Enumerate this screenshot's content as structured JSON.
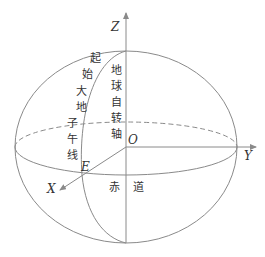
{
  "diagram": {
    "axes": {
      "z_label": "Z",
      "y_label": "Y",
      "x_label": "X",
      "origin_label": "O"
    },
    "points": {
      "e_label": "E"
    },
    "labels": {
      "meridian_chars": [
        "起",
        "始",
        "大",
        "地",
        "子",
        "午",
        "线"
      ],
      "rotation_axis_chars": [
        "地",
        "球",
        "自",
        "转",
        "轴"
      ],
      "equator_chars": [
        "赤",
        "道"
      ]
    },
    "colors": {
      "line": "#8a8a8a",
      "text": "#333333",
      "background": "#ffffff"
    }
  }
}
